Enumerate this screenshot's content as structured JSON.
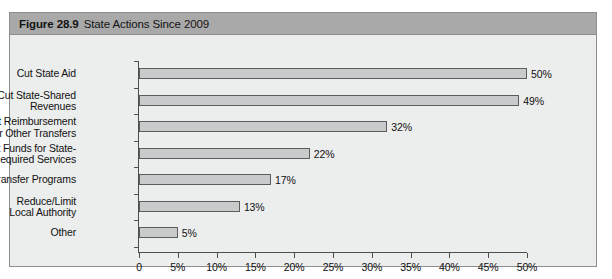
{
  "figure": {
    "number": "Figure 28.9",
    "title": "State Actions Since 2009",
    "header_bg": "#a9a9a9",
    "panel_bg": "#eceded",
    "border_color": "#8e8e8e"
  },
  "chart_data": {
    "type": "bar",
    "orientation": "horizontal",
    "title": "State Actions Since 2009",
    "xlabel": "",
    "ylabel": "",
    "categories": [
      "Cut State Aid",
      "Cut State-Shared\nRevenues",
      "Cut Reimbursement\nor Other Transfers",
      "Cut Funds for State-\nRequired Services",
      "Transfer Programs",
      "Reduce/Limit\nLocal Authority",
      "Other"
    ],
    "values": [
      50,
      49,
      32,
      22,
      17,
      13,
      5
    ],
    "value_labels": [
      "50%",
      "49%",
      "32%",
      "22%",
      "17%",
      "13%",
      "5%"
    ],
    "xlim": [
      0,
      50
    ],
    "xticks": [
      0,
      5,
      10,
      15,
      20,
      25,
      30,
      35,
      40,
      45,
      50
    ],
    "xtick_labels": [
      "0",
      "5%",
      "10%",
      "15%",
      "20%",
      "25%",
      "30%",
      "35%",
      "40%",
      "45%",
      "50%"
    ],
    "grid": false,
    "legend": null,
    "bar_fill": "#c9cacb",
    "bar_edge": "#5c5c5c",
    "axis_color": "#4d4d4d"
  }
}
